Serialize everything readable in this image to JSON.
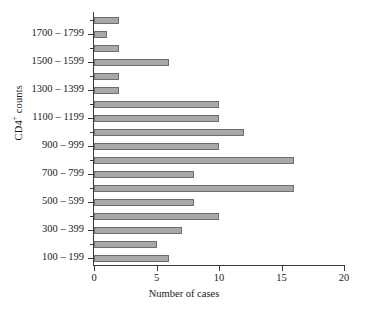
{
  "chart_data": {
    "type": "bar",
    "orientation": "horizontal",
    "title": "",
    "xlabel": "Number of cases",
    "ylabel": "CD4+ counts",
    "ylabel_base": "CD4",
    "ylabel_sup": "+",
    "ylabel_tail": " counts",
    "xlim": [
      0,
      20
    ],
    "xticks": [
      0,
      5,
      10,
      15,
      20
    ],
    "xticklabels": [
      "0",
      "5",
      "10",
      "15",
      "20"
    ],
    "grid": false,
    "legend": null,
    "bar_color": "#a8a8a8",
    "bar_edge_color": "#6e6e6e",
    "axis_color": "#3a3a3a",
    "categories": [
      "100 – 199",
      "200 – 299",
      "300 – 399",
      "400 – 499",
      "500 – 599",
      "600 – 699",
      "700 – 799",
      "800 – 899",
      "900 – 999",
      "1000 – 1099",
      "1100 – 1199",
      "1200 – 1299",
      "1300 – 1399",
      "1400 – 1499",
      "1500 – 1599",
      "1600 – 1699",
      "1700 – 1799",
      "1800 – 1899"
    ],
    "values": [
      6,
      5,
      7,
      10,
      8,
      16,
      8,
      16,
      10,
      12,
      10,
      10,
      2,
      2,
      6,
      2,
      1,
      2
    ],
    "ytick_labels": [
      "100 – 199",
      "300 – 399",
      "500 – 599",
      "700 – 799",
      "900 – 999",
      "1100 – 1199",
      "1300 – 1399",
      "1500 – 1599",
      "1700 – 1799"
    ],
    "ytick_category_indices": [
      0,
      2,
      4,
      6,
      8,
      10,
      12,
      14,
      16
    ]
  }
}
